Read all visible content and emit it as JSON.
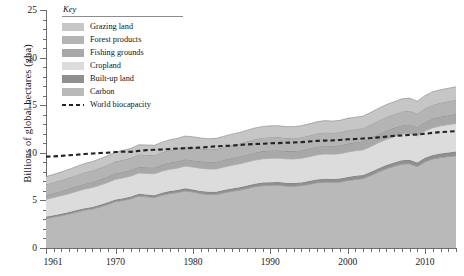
{
  "chart_data": {
    "type": "area",
    "title": "",
    "xlabel": "",
    "ylabel": "Billions of global hectares (gha)",
    "xlim": [
      1961,
      2014
    ],
    "ylim": [
      0,
      25
    ],
    "y_ticks": [
      0,
      5,
      10,
      15,
      20,
      25
    ],
    "y_minor_step": 1,
    "x_ticks": [
      1961,
      1970,
      1980,
      1990,
      2000,
      2010
    ],
    "x_minor_step": 1,
    "grid": false,
    "stacked": true,
    "legend_position": "top-left-inside",
    "x": [
      1961,
      1962,
      1963,
      1964,
      1965,
      1966,
      1967,
      1968,
      1969,
      1970,
      1971,
      1972,
      1973,
      1974,
      1975,
      1976,
      1977,
      1978,
      1979,
      1980,
      1981,
      1982,
      1983,
      1984,
      1985,
      1986,
      1987,
      1988,
      1989,
      1990,
      1991,
      1992,
      1993,
      1994,
      1995,
      1996,
      1997,
      1998,
      1999,
      2000,
      2001,
      2002,
      2003,
      2004,
      2005,
      2006,
      2007,
      2008,
      2009,
      2010,
      2011,
      2012,
      2013,
      2014
    ],
    "series": [
      {
        "name": "Carbon",
        "color": "#b9b9b9",
        "values": [
          3.1,
          3.25,
          3.4,
          3.58,
          3.78,
          3.98,
          4.1,
          4.32,
          4.58,
          4.88,
          5.0,
          5.18,
          5.45,
          5.38,
          5.3,
          5.55,
          5.72,
          5.82,
          6.0,
          5.88,
          5.72,
          5.62,
          5.62,
          5.8,
          5.95,
          6.08,
          6.25,
          6.45,
          6.55,
          6.58,
          6.6,
          6.52,
          6.5,
          6.55,
          6.68,
          6.85,
          6.92,
          6.9,
          6.92,
          7.1,
          7.2,
          7.3,
          7.62,
          8.0,
          8.32,
          8.58,
          8.82,
          8.85,
          8.55,
          9.05,
          9.35,
          9.5,
          9.6,
          9.7
        ]
      },
      {
        "name": "Built-up land",
        "color": "#8f8f8f",
        "values": [
          0.18,
          0.18,
          0.19,
          0.19,
          0.2,
          0.2,
          0.21,
          0.21,
          0.22,
          0.22,
          0.23,
          0.23,
          0.24,
          0.24,
          0.25,
          0.25,
          0.26,
          0.26,
          0.27,
          0.27,
          0.28,
          0.28,
          0.29,
          0.29,
          0.3,
          0.3,
          0.31,
          0.31,
          0.32,
          0.32,
          0.33,
          0.33,
          0.34,
          0.34,
          0.35,
          0.35,
          0.36,
          0.36,
          0.37,
          0.37,
          0.38,
          0.38,
          0.39,
          0.39,
          0.4,
          0.4,
          0.41,
          0.41,
          0.42,
          0.42,
          0.43,
          0.43,
          0.44,
          0.44
        ]
      },
      {
        "name": "Cropland",
        "color": "#dcdcdc",
        "values": [
          1.85,
          1.88,
          1.92,
          1.95,
          1.98,
          2.02,
          2.05,
          2.08,
          2.1,
          2.12,
          2.15,
          2.16,
          2.2,
          2.22,
          2.25,
          2.28,
          2.3,
          2.32,
          2.34,
          2.36,
          2.38,
          2.4,
          2.4,
          2.42,
          2.44,
          2.46,
          2.48,
          2.48,
          2.5,
          2.52,
          2.52,
          2.52,
          2.52,
          2.54,
          2.56,
          2.58,
          2.6,
          2.6,
          2.62,
          2.62,
          2.64,
          2.64,
          2.66,
          2.68,
          2.7,
          2.72,
          2.74,
          2.78,
          2.8,
          2.82,
          2.86,
          2.9,
          2.92,
          2.94
        ]
      },
      {
        "name": "Fishing grounds",
        "color": "#a8a8a8",
        "values": [
          0.45,
          0.47,
          0.49,
          0.52,
          0.54,
          0.56,
          0.58,
          0.6,
          0.61,
          0.62,
          0.63,
          0.62,
          0.64,
          0.65,
          0.66,
          0.68,
          0.69,
          0.7,
          0.71,
          0.72,
          0.73,
          0.74,
          0.75,
          0.76,
          0.77,
          0.78,
          0.79,
          0.8,
          0.81,
          0.82,
          0.82,
          0.82,
          0.83,
          0.84,
          0.85,
          0.86,
          0.87,
          0.86,
          0.87,
          0.88,
          0.88,
          0.89,
          0.9,
          0.91,
          0.92,
          0.92,
          0.93,
          0.94,
          0.94,
          0.95,
          0.96,
          0.97,
          0.98,
          0.99
        ]
      },
      {
        "name": "Forest products",
        "color": "#b4b4b4",
        "values": [
          1.1,
          1.12,
          1.14,
          1.16,
          1.18,
          1.2,
          1.2,
          1.22,
          1.24,
          1.26,
          1.26,
          1.28,
          1.3,
          1.3,
          1.28,
          1.3,
          1.32,
          1.33,
          1.34,
          1.34,
          1.33,
          1.32,
          1.33,
          1.34,
          1.35,
          1.36,
          1.38,
          1.39,
          1.4,
          1.4,
          1.38,
          1.36,
          1.35,
          1.36,
          1.38,
          1.38,
          1.39,
          1.38,
          1.38,
          1.4,
          1.38,
          1.38,
          1.4,
          1.42,
          1.43,
          1.44,
          1.45,
          1.44,
          1.38,
          1.44,
          1.46,
          1.46,
          1.47,
          1.48
        ]
      },
      {
        "name": "Grazing land",
        "color": "#c6c6c6",
        "values": [
          0.82,
          0.84,
          0.86,
          0.88,
          0.9,
          0.92,
          0.94,
          0.95,
          0.96,
          0.98,
          1.0,
          1.01,
          1.02,
          1.04,
          1.05,
          1.06,
          1.08,
          1.09,
          1.1,
          1.11,
          1.12,
          1.12,
          1.13,
          1.14,
          1.15,
          1.16,
          1.17,
          1.18,
          1.19,
          1.2,
          1.2,
          1.2,
          1.21,
          1.22,
          1.22,
          1.23,
          1.24,
          1.24,
          1.25,
          1.26,
          1.26,
          1.27,
          1.28,
          1.29,
          1.3,
          1.31,
          1.32,
          1.33,
          1.33,
          1.34,
          1.36,
          1.37,
          1.38,
          1.39
        ]
      }
    ],
    "overlay": {
      "name": "World biocapacity",
      "style": "dashed",
      "color": "#242424",
      "values": [
        9.6,
        9.62,
        9.68,
        9.75,
        9.8,
        9.88,
        9.92,
        9.98,
        10.02,
        10.08,
        10.12,
        10.1,
        10.2,
        10.28,
        10.32,
        10.35,
        10.4,
        10.45,
        10.48,
        10.52,
        10.55,
        10.62,
        10.68,
        10.72,
        10.75,
        10.82,
        10.88,
        10.92,
        10.95,
        11.0,
        11.02,
        11.05,
        11.08,
        11.12,
        11.18,
        11.25,
        11.28,
        11.3,
        11.35,
        11.42,
        11.45,
        11.5,
        11.55,
        11.62,
        11.7,
        11.78,
        11.82,
        11.88,
        11.92,
        12.0,
        12.1,
        12.18,
        12.22,
        12.28
      ]
    }
  },
  "legend": {
    "title": "Key",
    "items": [
      {
        "label": "Grazing land",
        "color": "#c6c6c6",
        "style": "swatch"
      },
      {
        "label": "Forest products",
        "color": "#b4b4b4",
        "style": "swatch"
      },
      {
        "label": "Fishing grounds",
        "color": "#a8a8a8",
        "style": "swatch"
      },
      {
        "label": "Cropland",
        "color": "#dcdcdc",
        "style": "swatch"
      },
      {
        "label": "Built-up land",
        "color": "#8f8f8f",
        "style": "swatch"
      },
      {
        "label": "Carbon",
        "color": "#b9b9b9",
        "style": "swatch"
      },
      {
        "label": "World biocapacity",
        "color": "#242424",
        "style": "dashed"
      }
    ]
  }
}
